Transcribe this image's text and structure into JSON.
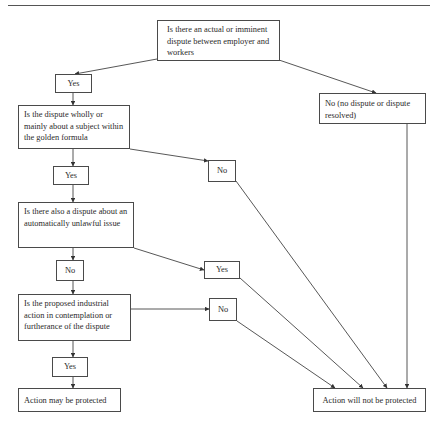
{
  "diagram": {
    "nodes": {
      "q1": "Is there an actual or imminent dispute between employer and workers",
      "yes1": "Yes",
      "q2": "Is the dispute wholly or mainly about a subject within the golden formula",
      "no_right": "No (no dispute or dispute resolved)",
      "no_mid": "No",
      "yes2": "Yes",
      "q3": "Is there also a dispute about an automatically unlawful issue",
      "no2": "No",
      "yes_mid": "Yes",
      "q4": "Is the proposed industrial action in contemplation or furtherance of the dispute",
      "no3": "No",
      "yes3": "Yes",
      "final_left": "Action may be protected",
      "final_right": "Action will not be protected"
    },
    "edges": [
      {
        "from": "q1",
        "to": "yes1"
      },
      {
        "from": "q1",
        "to": "no_right"
      },
      {
        "from": "yes1",
        "to": "q2"
      },
      {
        "from": "q2",
        "to": "yes2"
      },
      {
        "from": "q2",
        "to": "no_mid"
      },
      {
        "from": "yes2",
        "to": "q3"
      },
      {
        "from": "q3",
        "to": "no2"
      },
      {
        "from": "q3",
        "to": "yes_mid"
      },
      {
        "from": "no2",
        "to": "q4"
      },
      {
        "from": "q4",
        "to": "yes3"
      },
      {
        "from": "q4",
        "to": "no3"
      },
      {
        "from": "yes3",
        "to": "final_left"
      },
      {
        "from": "no3",
        "to": "final_right"
      },
      {
        "from": "yes_mid",
        "to": "final_right"
      },
      {
        "from": "no_mid",
        "to": "final_right"
      },
      {
        "from": "no_right",
        "to": "final_right"
      }
    ]
  }
}
